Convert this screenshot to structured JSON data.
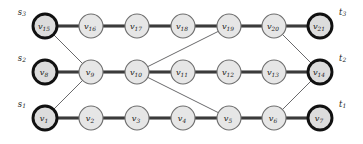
{
  "figure": {
    "type": "graph-diagram",
    "width": 363,
    "height": 144,
    "background": "#ffffff",
    "node_fill": "#e6e6e6",
    "node_stroke": "#6e6e6e",
    "terminal_stroke": "#111111",
    "path_edge_color": "#3b3b3b",
    "cross_edge_color": "#58585a"
  },
  "layout": {
    "columns_x": [
      45,
      91,
      137,
      183,
      229,
      274,
      320
    ],
    "rows_y": [
      118,
      72,
      26
    ],
    "node_radius": 13,
    "terminal_radius": 13
  },
  "nodes": [
    {
      "id": "v1",
      "base": "v",
      "sub": "1",
      "cx": 45,
      "cy": 118,
      "terminal": true
    },
    {
      "id": "v2",
      "base": "v",
      "sub": "2",
      "cx": 91,
      "cy": 118,
      "terminal": false
    },
    {
      "id": "v3",
      "base": "v",
      "sub": "3",
      "cx": 137,
      "cy": 118,
      "terminal": false
    },
    {
      "id": "v4",
      "base": "v",
      "sub": "4",
      "cx": 183,
      "cy": 118,
      "terminal": false
    },
    {
      "id": "v5",
      "base": "v",
      "sub": "5",
      "cx": 229,
      "cy": 118,
      "terminal": false
    },
    {
      "id": "v6",
      "base": "v",
      "sub": "6",
      "cx": 274,
      "cy": 118,
      "terminal": false
    },
    {
      "id": "v7",
      "base": "v",
      "sub": "7",
      "cx": 320,
      "cy": 118,
      "terminal": true
    },
    {
      "id": "v8",
      "base": "v",
      "sub": "8",
      "cx": 45,
      "cy": 72,
      "terminal": true
    },
    {
      "id": "v9",
      "base": "v",
      "sub": "9",
      "cx": 91,
      "cy": 72,
      "terminal": false
    },
    {
      "id": "v10",
      "base": "v",
      "sub": "10",
      "cx": 137,
      "cy": 72,
      "terminal": false
    },
    {
      "id": "v11",
      "base": "v",
      "sub": "11",
      "cx": 183,
      "cy": 72,
      "terminal": false
    },
    {
      "id": "v12",
      "base": "v",
      "sub": "12",
      "cx": 229,
      "cy": 72,
      "terminal": false
    },
    {
      "id": "v13",
      "base": "v",
      "sub": "13",
      "cx": 274,
      "cy": 72,
      "terminal": false
    },
    {
      "id": "v14",
      "base": "v",
      "sub": "14",
      "cx": 320,
      "cy": 72,
      "terminal": true
    },
    {
      "id": "v15",
      "base": "v",
      "sub": "15",
      "cx": 45,
      "cy": 26,
      "terminal": true
    },
    {
      "id": "v16",
      "base": "v",
      "sub": "16",
      "cx": 91,
      "cy": 26,
      "terminal": false
    },
    {
      "id": "v17",
      "base": "v",
      "sub": "17",
      "cx": 137,
      "cy": 26,
      "terminal": false
    },
    {
      "id": "v18",
      "base": "v",
      "sub": "18",
      "cx": 183,
      "cy": 26,
      "terminal": false
    },
    {
      "id": "v19",
      "base": "v",
      "sub": "19",
      "cx": 229,
      "cy": 26,
      "terminal": false
    },
    {
      "id": "v20",
      "base": "v",
      "sub": "20",
      "cx": 274,
      "cy": 26,
      "terminal": false
    },
    {
      "id": "v21",
      "base": "v",
      "sub": "21",
      "cx": 320,
      "cy": 26,
      "terminal": true
    }
  ],
  "path_edges": [
    {
      "from": "v1",
      "to": "v2"
    },
    {
      "from": "v2",
      "to": "v3"
    },
    {
      "from": "v3",
      "to": "v4"
    },
    {
      "from": "v4",
      "to": "v5"
    },
    {
      "from": "v5",
      "to": "v6"
    },
    {
      "from": "v6",
      "to": "v7"
    },
    {
      "from": "v8",
      "to": "v9"
    },
    {
      "from": "v9",
      "to": "v10"
    },
    {
      "from": "v10",
      "to": "v11"
    },
    {
      "from": "v11",
      "to": "v12"
    },
    {
      "from": "v12",
      "to": "v13"
    },
    {
      "from": "v13",
      "to": "v14"
    },
    {
      "from": "v15",
      "to": "v16"
    },
    {
      "from": "v16",
      "to": "v17"
    },
    {
      "from": "v17",
      "to": "v18"
    },
    {
      "from": "v18",
      "to": "v19"
    },
    {
      "from": "v19",
      "to": "v20"
    },
    {
      "from": "v20",
      "to": "v21"
    }
  ],
  "cross_edges": [
    {
      "from": "v15",
      "to": "v9"
    },
    {
      "from": "v9",
      "to": "v1"
    },
    {
      "from": "v10",
      "to": "v19"
    },
    {
      "from": "v10",
      "to": "v5"
    },
    {
      "from": "v20",
      "to": "v14"
    },
    {
      "from": "v6",
      "to": "v14"
    }
  ],
  "terminal_labels": [
    {
      "id": "s1",
      "base": "s",
      "sub": "1",
      "x": 26,
      "y": 104,
      "side": "left"
    },
    {
      "id": "s2",
      "base": "s",
      "sub": "2",
      "x": 26,
      "y": 58,
      "side": "left"
    },
    {
      "id": "s3",
      "base": "s",
      "sub": "3",
      "x": 26,
      "y": 12,
      "side": "left"
    },
    {
      "id": "t1",
      "base": "t",
      "sub": "1",
      "x": 339,
      "y": 104,
      "side": "right"
    },
    {
      "id": "t2",
      "base": "t",
      "sub": "2",
      "x": 339,
      "y": 58,
      "side": "right"
    },
    {
      "id": "t3",
      "base": "t",
      "sub": "3",
      "x": 339,
      "y": 12,
      "side": "right"
    }
  ]
}
